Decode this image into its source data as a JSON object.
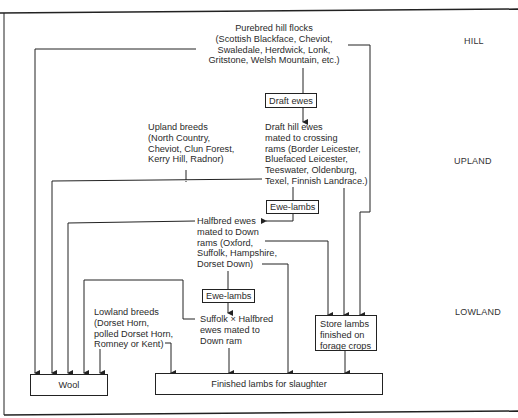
{
  "zones": {
    "hill": "HILL",
    "upland": "UPLAND",
    "lowland": "LOWLAND"
  },
  "nodes": {
    "purebred_hill_flocks": "Purebred hill flocks\n(Scottish Blackface, Cheviot,\nSwaledale, Herdwick, Lonk,\nGritstone, Welsh Mountain, etc.)",
    "draft_ewes": "Draft ewes",
    "draft_hill_ewes": "Draft hill ewes\nmated to crossing\nrams (Border Leicester,\nBluefaced Leicester,\nTeeswater, Oldenburg,\nTexel, Finnish Landrace.)",
    "upland_breeds": "Upland breeds\n(North Country,\nCheviot, Clun Forest,\nKerry Hill, Radnor)",
    "ewe_lambs_upper": "Ewe-lambs",
    "halfbred_ewes": "Halfbred ewes\nmated to Down\nrams (Oxford,\nSuffolk, Hampshire,\nDorset Down)",
    "ewe_lambs_lower": "Ewe-lambs",
    "suffolk_halfbred": "Suffolk × Halfbred\newes mated to\nDown ram",
    "lowland_breeds": "Lowland breeds\n(Dorset Horn,\npolled Dorset Horn,\nRomney or Kent)",
    "store_lambs": "Store lambs\nfinished on\nforage crops",
    "wool": "Wool",
    "finished_lambs": "Finished lambs for slaughter"
  }
}
